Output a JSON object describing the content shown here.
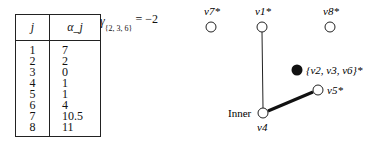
{
  "table": {
    "headers": [
      "j",
      "α_j"
    ],
    "rows": [
      {
        "j": "1",
        "alpha": "7"
      },
      {
        "j": "2",
        "alpha": "2"
      },
      {
        "j": "3",
        "alpha": "0"
      },
      {
        "j": "4",
        "alpha": "1"
      },
      {
        "j": "5",
        "alpha": "1"
      },
      {
        "j": "6",
        "alpha": "4"
      },
      {
        "j": "7",
        "alpha": "10.5"
      },
      {
        "j": "8",
        "alpha": "11"
      }
    ]
  },
  "gamma": {
    "symbol": "γ",
    "subscript": "{2, 3, 6}",
    "value": "= −2"
  },
  "graph": {
    "nodes": [
      {
        "id": "v7",
        "label": "v7*",
        "x": 211,
        "y": 27,
        "filled": false
      },
      {
        "id": "v1",
        "label": "v1*",
        "x": 262,
        "y": 27,
        "filled": false
      },
      {
        "id": "v8",
        "label": "v8*",
        "x": 330,
        "y": 27,
        "filled": false
      },
      {
        "id": "v2v3v6",
        "label": "{v2, v3, v6}*",
        "x": 297,
        "y": 70,
        "filled": true
      },
      {
        "id": "v5",
        "label": "v5*",
        "x": 318,
        "y": 90,
        "filled": false
      },
      {
        "id": "v4",
        "label": "v4",
        "x": 263,
        "y": 113,
        "filled": false
      }
    ],
    "edges": [
      {
        "from": "v1",
        "to": "v4",
        "weight": "thin"
      },
      {
        "from": "v4",
        "to": "v5",
        "weight": "thick"
      }
    ],
    "inner_label": "Inner"
  }
}
